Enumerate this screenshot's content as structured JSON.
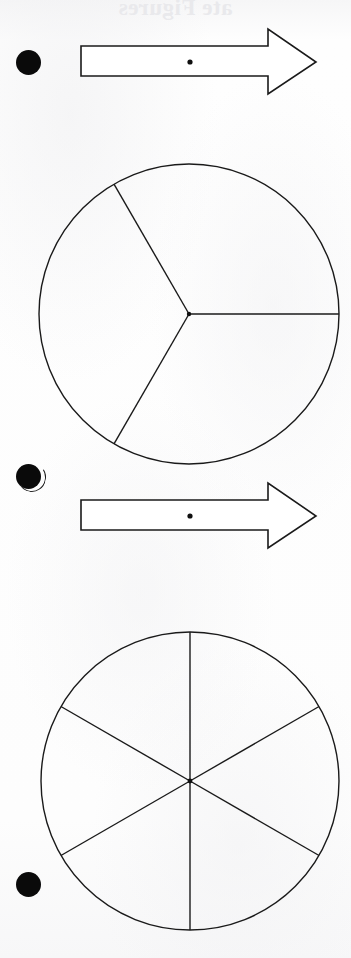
{
  "page": {
    "width": 351,
    "height": 958,
    "background_color": "#fdfdfd",
    "ink_color": "#1a1a1a",
    "ghost_header_text": "ate Figures",
    "document_type": "scanned math worksheet"
  },
  "bullets": [
    {
      "name": "bullet-1",
      "label": "•",
      "cx": 28,
      "cy": 62,
      "r": 12.5
    },
    {
      "name": "bullet-2",
      "label": "•",
      "cx": 28,
      "cy": 476,
      "r": 12.5
    },
    {
      "name": "bullet-3",
      "label": "•",
      "cx": 28,
      "cy": 884,
      "r": 12.5
    }
  ],
  "arrows": [
    {
      "name": "arrow-1",
      "direction": "right",
      "shaft_x": 81,
      "shaft_y": 46,
      "shaft_width": 188,
      "shaft_height": 30,
      "head_x": 268,
      "head_top": 29,
      "head_bottom": 94,
      "tip_x": 316,
      "tip_y": 62,
      "center_dot_x": 190,
      "center_dot_y": 62,
      "center_dot_r": 2.6,
      "meaning": "transformation arrow with center point"
    },
    {
      "name": "arrow-2",
      "direction": "right",
      "shaft_x": 81,
      "shaft_y": 500,
      "shaft_width": 188,
      "shaft_height": 30,
      "head_x": 268,
      "head_top": 483,
      "head_bottom": 548,
      "tip_x": 316,
      "tip_y": 516,
      "center_dot_x": 190,
      "center_dot_y": 516,
      "center_dot_r": 2.6,
      "meaning": "transformation arrow with center point"
    }
  ],
  "chart_data": [
    {
      "name": "circle-thirds",
      "type": "pie",
      "title": "Circle divided into thirds",
      "cx": 189,
      "cy": 314,
      "r": 150,
      "slices": 3,
      "categories": [
        "Third 1",
        "Third 2",
        "Third 3"
      ],
      "values": [
        1,
        1,
        1
      ],
      "fraction_each": "1/3",
      "radius_angles_deg": [
        0,
        120,
        240
      ],
      "fill": "none",
      "stroke": "#1a1a1a",
      "stroke_width": 1.4,
      "center_dot": true
    },
    {
      "name": "circle-sixths",
      "type": "pie",
      "title": "Circle divided into sixths",
      "cx": 190,
      "cy": 781,
      "r": 149,
      "slices": 6,
      "categories": [
        "Sixth 1",
        "Sixth 2",
        "Sixth 3",
        "Sixth 4",
        "Sixth 5",
        "Sixth 6"
      ],
      "values": [
        1,
        1,
        1,
        1,
        1,
        1
      ],
      "fraction_each": "1/6",
      "radius_angles_deg": [
        30,
        90,
        150,
        210,
        270,
        330
      ],
      "fill": "none",
      "stroke": "#1a1a1a",
      "stroke_width": 1.4,
      "center_dot": true
    }
  ]
}
